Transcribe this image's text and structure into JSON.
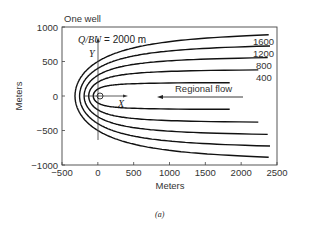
{
  "chart_data": {
    "type": "line",
    "title": "One well",
    "annotation": "Q/BU = 2000 m",
    "xlabel": "Meters",
    "ylabel": "Meters",
    "caption": "(a)",
    "xlim": [
      -500,
      2500
    ],
    "ylim": [
      -1000,
      1000
    ],
    "xticks": [
      -500,
      0,
      500,
      1000,
      1500,
      2000,
      2500
    ],
    "yticks": [
      -1000,
      -500,
      0,
      500,
      1000
    ],
    "xtick_labels": [
      "-500",
      "0",
      "500",
      "1000",
      "1500",
      "2000",
      "2500"
    ],
    "ytick_labels": [
      "-1000",
      "-500",
      "0",
      "500",
      "1000"
    ],
    "series": [
      {
        "name": "400",
        "label": "400",
        "x_end": 2300
      },
      {
        "name": "800",
        "label": "800",
        "x_end": 2500
      },
      {
        "name": "1200",
        "label": "1200",
        "x_end": 2500
      },
      {
        "name": "1600",
        "label": "1600",
        "x_end": 2500
      },
      {
        "name": "2000",
        "label": "",
        "x_end": 2500
      }
    ],
    "flow_arrow_label": "Regional flow",
    "axis_labels_local": {
      "x": "X",
      "y": "Y"
    },
    "grid": false
  }
}
